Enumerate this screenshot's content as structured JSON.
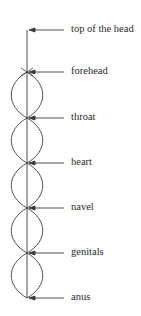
{
  "diagram": {
    "labels": [
      {
        "text": "top of the head",
        "y": 30
      },
      {
        "text": "forehead",
        "y": 72
      },
      {
        "text": "throat",
        "y": 118
      },
      {
        "text": "heart",
        "y": 163
      },
      {
        "text": "navel",
        "y": 208
      },
      {
        "text": "genitals",
        "y": 253
      },
      {
        "text": "anus",
        "y": 298
      }
    ],
    "stroke_color": "#3a3a3a",
    "background": "#ffffff"
  }
}
